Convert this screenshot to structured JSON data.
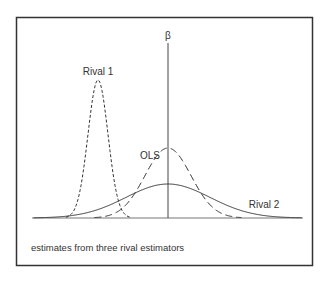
{
  "diagram": {
    "title_symbol": "β",
    "labels": {
      "rival1": "Rival 1",
      "ols": "OLS",
      "rival2": "Rival 2"
    },
    "caption": "estimates from three rival estimators",
    "curves": [
      {
        "name": "Rival 1",
        "style": "short-dash",
        "peak_x": 98,
        "peak_y": 80,
        "sigma": 10
      },
      {
        "name": "OLS",
        "style": "long-dash",
        "peak_x": 168,
        "peak_y": 148,
        "sigma": 23
      },
      {
        "name": "Rival 2",
        "style": "solid",
        "peak_x": 168,
        "peak_y": 184,
        "sigma": 42
      }
    ],
    "colors": {
      "line": "#333333",
      "border": "#333333"
    }
  }
}
